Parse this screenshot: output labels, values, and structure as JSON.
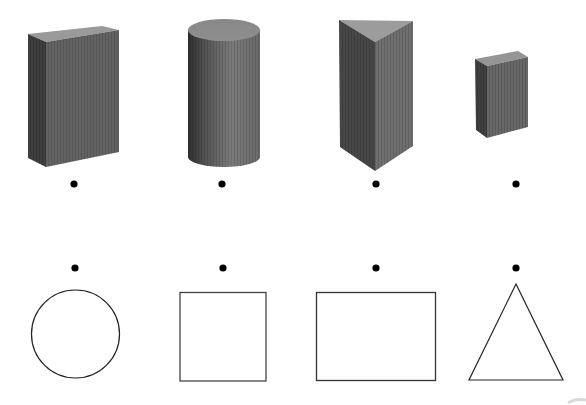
{
  "colors": {
    "background": "#ffffff",
    "solid_dark": "#3f3f3f",
    "solid_mid": "#5e5e5e",
    "solid_light": "#8a8a8a",
    "solid_top": "#9a9a9a",
    "outline": "#222222",
    "dot": "#000000"
  },
  "solids": [
    {
      "id": "cuboid",
      "label": "rectangular prism (cuboid)",
      "dot": {
        "x": 74,
        "y": 184
      }
    },
    {
      "id": "cylinder",
      "label": "cylinder",
      "dot": {
        "x": 222,
        "y": 184
      }
    },
    {
      "id": "triangular-prism",
      "label": "triangular prism",
      "dot": {
        "x": 376,
        "y": 184
      }
    },
    {
      "id": "cube",
      "label": "cube",
      "dot": {
        "x": 516,
        "y": 184
      }
    }
  ],
  "shapes": [
    {
      "id": "circle",
      "label": "circle",
      "dot": {
        "x": 75,
        "y": 268
      }
    },
    {
      "id": "square",
      "label": "square",
      "dot": {
        "x": 223,
        "y": 268
      }
    },
    {
      "id": "rectangle",
      "label": "rectangle",
      "dot": {
        "x": 376,
        "y": 268
      }
    },
    {
      "id": "triangle",
      "label": "triangle",
      "dot": {
        "x": 516,
        "y": 268
      }
    }
  ]
}
